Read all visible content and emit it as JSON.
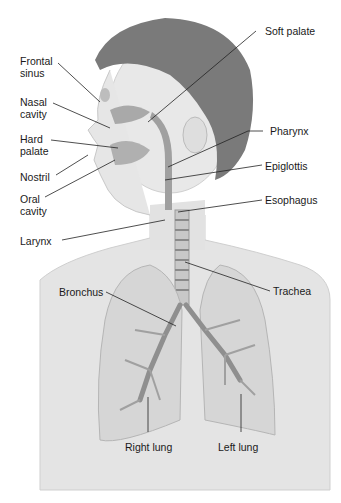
{
  "diagram": {
    "labels": {
      "frontal_sinus": "Frontal sinus",
      "nasal_cavity": "Nasal cavity",
      "hard_palate": "Hard palate",
      "nostril": "Nostril",
      "oral_cavity": "Oral cavity",
      "larynx": "Larynx",
      "soft_palate": "Soft palate",
      "pharynx": "Pharynx",
      "epiglottis": "Epiglottis",
      "esophagus": "Esophagus",
      "bronchus": "Bronchus",
      "trachea": "Trachea",
      "right_lung": "Right lung",
      "left_lung": "Left lung"
    },
    "colors": {
      "skin": "#e6e6e6",
      "hair": "#6e6e6e",
      "lung": "#d8d8d8",
      "airway": "#9a9a9a",
      "leader_line": "#222222"
    }
  }
}
